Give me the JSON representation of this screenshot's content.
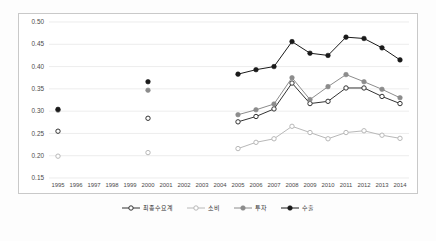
{
  "chart_data": {
    "type": "line",
    "title": "",
    "subtitle": "",
    "xlabel": "",
    "ylabel": "",
    "x": [
      1995,
      1996,
      1997,
      1998,
      1999,
      2000,
      2001,
      2002,
      2003,
      2004,
      2005,
      2006,
      2007,
      2008,
      2009,
      2010,
      2011,
      2012,
      2013,
      2014
    ],
    "xtick_labels": [
      "1995",
      "1996",
      "1997",
      "1998",
      "1999",
      "2000",
      "2001",
      "2002",
      "2003",
      "2004",
      "2005",
      "2006",
      "2007",
      "2008",
      "2009",
      "2010",
      "2011",
      "2012",
      "2013",
      "2014"
    ],
    "ylim": [
      0.15,
      0.5
    ],
    "ytick_labels": [
      "0.15",
      "0.20",
      "0.25",
      "0.30",
      "0.35",
      "0.40",
      "0.45",
      "0.50"
    ],
    "ytick_values": [
      0.15,
      0.2,
      0.25,
      0.3,
      0.35,
      0.4,
      0.45,
      0.5
    ],
    "grid": "horizontal",
    "legend_position": "bottom",
    "series": [
      {
        "name": "최종수요계",
        "marker": "open-circle",
        "color": "#333333",
        "points": [
          {
            "x": 1995,
            "y": 0.255
          },
          {
            "x": 2000,
            "y": 0.284
          },
          {
            "x": 2005,
            "y": 0.276
          },
          {
            "x": 2006,
            "y": 0.288
          },
          {
            "x": 2007,
            "y": 0.305
          },
          {
            "x": 2008,
            "y": 0.363
          },
          {
            "x": 2009,
            "y": 0.317
          },
          {
            "x": 2010,
            "y": 0.322
          },
          {
            "x": 2011,
            "y": 0.352
          },
          {
            "x": 2012,
            "y": 0.352
          },
          {
            "x": 2013,
            "y": 0.333
          },
          {
            "x": 2014,
            "y": 0.317
          }
        ]
      },
      {
        "name": "소비",
        "marker": "open-circle",
        "color": "#b8b8b8",
        "points": [
          {
            "x": 1995,
            "y": 0.199
          },
          {
            "x": 2000,
            "y": 0.207
          },
          {
            "x": 2005,
            "y": 0.216
          },
          {
            "x": 2006,
            "y": 0.23
          },
          {
            "x": 2007,
            "y": 0.238
          },
          {
            "x": 2008,
            "y": 0.266
          },
          {
            "x": 2009,
            "y": 0.252
          },
          {
            "x": 2010,
            "y": 0.238
          },
          {
            "x": 2011,
            "y": 0.252
          },
          {
            "x": 2012,
            "y": 0.256
          },
          {
            "x": 2013,
            "y": 0.246
          },
          {
            "x": 2014,
            "y": 0.239
          }
        ]
      },
      {
        "name": "투자",
        "marker": "filled-circle",
        "color": "#8c8c8c",
        "points": [
          {
            "x": 1995,
            "y": 0.302
          },
          {
            "x": 2000,
            "y": 0.347
          },
          {
            "x": 2005,
            "y": 0.292
          },
          {
            "x": 2006,
            "y": 0.303
          },
          {
            "x": 2007,
            "y": 0.316
          },
          {
            "x": 2008,
            "y": 0.375
          },
          {
            "x": 2009,
            "y": 0.326
          },
          {
            "x": 2010,
            "y": 0.355
          },
          {
            "x": 2011,
            "y": 0.382
          },
          {
            "x": 2012,
            "y": 0.366
          },
          {
            "x": 2013,
            "y": 0.349
          },
          {
            "x": 2014,
            "y": 0.33
          }
        ]
      },
      {
        "name": "수출",
        "marker": "filled-circle",
        "color": "#1a1a1a",
        "points": [
          {
            "x": 1995,
            "y": 0.304
          },
          {
            "x": 2000,
            "y": 0.366
          },
          {
            "x": 2005,
            "y": 0.383
          },
          {
            "x": 2006,
            "y": 0.393
          },
          {
            "x": 2007,
            "y": 0.4
          },
          {
            "x": 2008,
            "y": 0.456
          },
          {
            "x": 2009,
            "y": 0.43
          },
          {
            "x": 2010,
            "y": 0.425
          },
          {
            "x": 2011,
            "y": 0.466
          },
          {
            "x": 2012,
            "y": 0.463
          },
          {
            "x": 2013,
            "y": 0.442
          },
          {
            "x": 2014,
            "y": 0.415
          }
        ]
      }
    ]
  },
  "legend": {
    "items": [
      {
        "label": "최종수요계"
      },
      {
        "label": "소비"
      },
      {
        "label": "투자"
      },
      {
        "label": "수출"
      }
    ]
  },
  "caption": {
    "text": ""
  }
}
